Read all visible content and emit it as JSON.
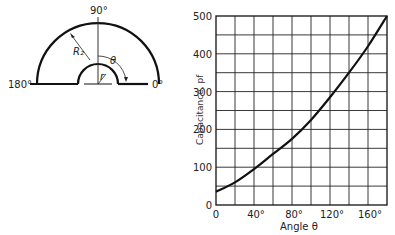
{
  "diagram": {
    "labels": {
      "top": "90°",
      "left": "180°",
      "right": "0°",
      "outer_radius": "R₂",
      "inner_radius": "r",
      "angle": "θ"
    }
  },
  "chart_data": {
    "type": "line",
    "title": "",
    "xlabel": "Angle θ",
    "ylabel": "Capacitance, pf",
    "x": [
      0,
      20,
      40,
      60,
      80,
      100,
      120,
      140,
      160,
      180
    ],
    "series": [
      {
        "name": "Capacitance",
        "values": [
          35,
          60,
          95,
          135,
          175,
          225,
          285,
          350,
          420,
          500
        ]
      }
    ],
    "xlim": [
      0,
      180
    ],
    "ylim": [
      0,
      500
    ],
    "x_tick_labels": [
      "0",
      "40°",
      "80°",
      "120°",
      "160°"
    ],
    "y_tick_labels": [
      "0",
      "100",
      "200",
      "300",
      "400",
      "500"
    ],
    "grid": true,
    "legend": "none"
  }
}
